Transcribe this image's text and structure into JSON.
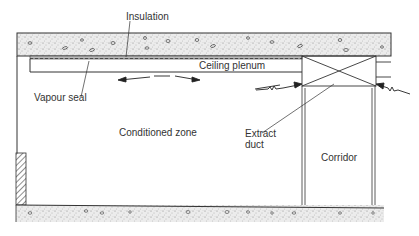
{
  "diagram": {
    "labels": {
      "insulation": "Insulation",
      "ceiling_plenum": "Ceiling plenum",
      "vapour_seal": "Vapour seal",
      "conditioned_zone": "Conditioned zone",
      "extract_duct_line1": "Extract",
      "extract_duct_line2": "duct",
      "corridor": "Corridor"
    },
    "colors": {
      "line": "#333333",
      "concrete_fill": "#e9e9e9",
      "background": "#ffffff"
    }
  }
}
